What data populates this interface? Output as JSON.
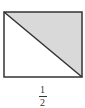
{
  "figure": {
    "shape": "rectangle",
    "diagonal": "top-left to bottom-right",
    "shaded_region": "upper-right triangle",
    "colors": {
      "stroke": "#333333",
      "shade": "#d9d9d9",
      "background": "#ffffff"
    }
  },
  "label": {
    "numerator": "1",
    "denominator": "2"
  }
}
